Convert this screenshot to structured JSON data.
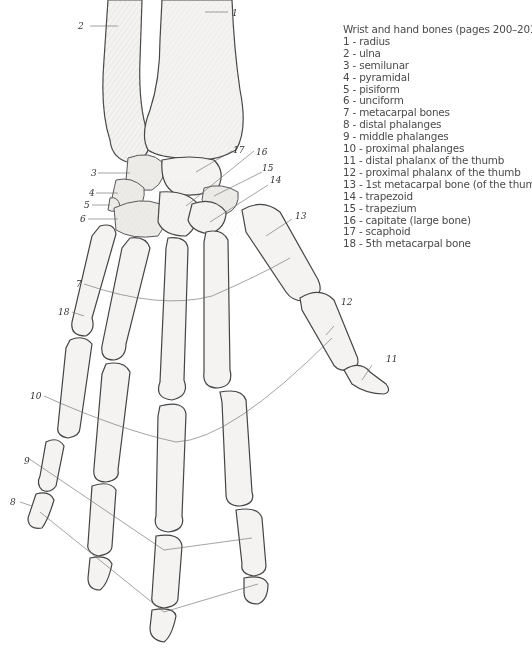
{
  "legend": {
    "title": "Wrist and hand bones (pages 200–201):",
    "items": [
      {
        "num": "1",
        "label": "1 - radius"
      },
      {
        "num": "2",
        "label": "2 - ulna"
      },
      {
        "num": "3",
        "label": "3 - semilunar"
      },
      {
        "num": "4",
        "label": "4 - pyramidal"
      },
      {
        "num": "5",
        "label": "5 - pisiform"
      },
      {
        "num": "6",
        "label": "6 - unciform"
      },
      {
        "num": "7",
        "label": "7 - metacarpal bones"
      },
      {
        "num": "8",
        "label": "8 - distal phalanges"
      },
      {
        "num": "9",
        "label": "9 - middle phalanges"
      },
      {
        "num": "10",
        "label": "10 - proximal phalanges"
      },
      {
        "num": "11",
        "label": "11 - distal phalanx of the thumb"
      },
      {
        "num": "12",
        "label": "12 - proximal phalanx of the thumb"
      },
      {
        "num": "13",
        "label": "13 - 1st metacarpal bone (of the thumb)"
      },
      {
        "num": "14",
        "label": "14 - trapezoid"
      },
      {
        "num": "15",
        "label": "15 - trapezium"
      },
      {
        "num": "16",
        "label": "16 - capitate (large bone)"
      },
      {
        "num": "17",
        "label": "17 - scaphoid"
      },
      {
        "num": "18",
        "label": "18 - 5th metacarpal bone"
      }
    ]
  },
  "callouts": {
    "c1": "1",
    "c2": "2",
    "c3": "3",
    "c4": "4",
    "c5": "5",
    "c6": "6",
    "c7": "7",
    "c8": "8",
    "c9": "9",
    "c10": "10",
    "c11": "11",
    "c12": "12",
    "c13": "13",
    "c14": "14",
    "c15": "15",
    "c16": "16",
    "c17": "17",
    "c18": "18"
  },
  "colors": {
    "background": "#ffffff",
    "bone_fill": "#f4f3f1",
    "outline": "#444444",
    "legend_text": "#4a4a4a"
  }
}
